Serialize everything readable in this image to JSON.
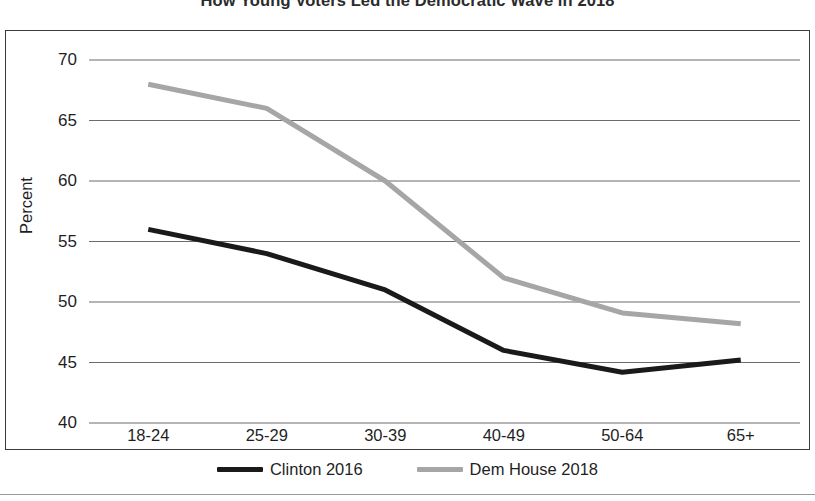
{
  "chart_data": {
    "type": "line",
    "title": "How Young Voters Led the Democratic Wave in 2018",
    "xlabel": "",
    "ylabel": "Percent",
    "categories": [
      "18-24",
      "25-29",
      "30-39",
      "40-49",
      "50-64",
      "65+"
    ],
    "series": [
      {
        "name": "Clinton 2016",
        "color": "#1a1a1a",
        "values": [
          56.0,
          54.0,
          51.0,
          46.0,
          44.2,
          45.2
        ]
      },
      {
        "name": "Dem House 2018",
        "color": "#a6a6a6",
        "values": [
          68.0,
          66.0,
          60.0,
          52.0,
          49.1,
          48.2
        ]
      }
    ],
    "ylim": [
      40,
      70
    ],
    "y_ticks": [
      40,
      45,
      50,
      55,
      60,
      65,
      70
    ],
    "grid": "horizontal",
    "legend_position": "bottom",
    "markers": "none"
  },
  "axis": {
    "y_title": "Percent",
    "y_tick_labels": [
      "70",
      "65",
      "60",
      "55",
      "50",
      "45",
      "40"
    ],
    "x_tick_labels": [
      "18-24",
      "25-29",
      "30-39",
      "40-49",
      "50-64",
      "65+"
    ]
  },
  "legend": {
    "items": [
      {
        "label": "Clinton 2016",
        "color": "#1a1a1a"
      },
      {
        "label": "Dem House 2018",
        "color": "#a6a6a6"
      }
    ]
  },
  "colors": {
    "clinton_2016": "#1a1a1a",
    "dem_house_2018": "#a6a6a6",
    "gridline": "#6b6b6b",
    "frame": "#3c3c3c",
    "background": "#ffffff"
  }
}
